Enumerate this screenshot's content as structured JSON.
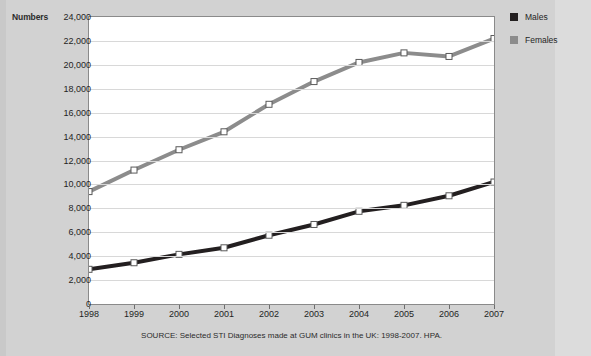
{
  "figure": {
    "y_axis_title": "Numbers",
    "source_note": "SOURCE: Selected STI Diagnoses made at GUM clinics in the UK: 1998-2007. HPA."
  },
  "legend": {
    "position": "right",
    "items": [
      {
        "label": "Males",
        "color": "#231f20"
      },
      {
        "label": "Females",
        "color": "#8c8c8c"
      }
    ]
  },
  "colors": {
    "males": "#231f20",
    "females": "#8c8c8c",
    "marker_fill": "#ffffff",
    "marker_stroke": "#5a5a5a",
    "plot_background": "#ffffff",
    "page_background": "#d2d2d2",
    "gridline": "#d8d8d8",
    "frame": "#8a8a8a"
  },
  "chart_data": {
    "type": "line",
    "title": "",
    "xlabel": "",
    "ylabel": "Numbers",
    "categories": [
      "1998",
      "1999",
      "2000",
      "2001",
      "2002",
      "2003",
      "2004",
      "2005",
      "2006",
      "2007"
    ],
    "x": [
      1998,
      1999,
      2000,
      2001,
      2002,
      2003,
      2004,
      2005,
      2006,
      2007
    ],
    "series": [
      {
        "name": "Males",
        "color": "#231f20",
        "values": [
          2900,
          3450,
          4150,
          4700,
          5750,
          6650,
          7750,
          8250,
          9050,
          10200
        ]
      },
      {
        "name": "Females",
        "color": "#8c8c8c",
        "values": [
          9400,
          11200,
          12900,
          14400,
          16700,
          18600,
          20200,
          21000,
          20700,
          22200
        ]
      }
    ],
    "ylim": [
      0,
      24000
    ],
    "ytick_values": [
      0,
      2000,
      4000,
      6000,
      8000,
      10000,
      12000,
      14000,
      16000,
      18000,
      20000,
      22000,
      24000
    ],
    "ytick_labels": [
      "0",
      "2,000",
      "4,000",
      "6,000",
      "8,000",
      "10,000",
      "12,000",
      "14,000",
      "16,000",
      "18,000",
      "20,000",
      "22,000",
      "24,000"
    ],
    "grid": true,
    "grid_axis": "y",
    "legend_position": "right",
    "marker": "square",
    "line_width": 4
  }
}
